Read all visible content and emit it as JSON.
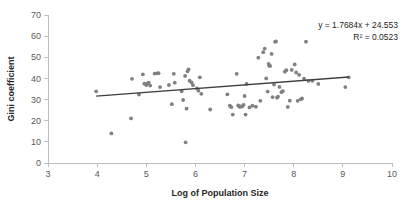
{
  "chart_data": {
    "type": "scatter",
    "title": "",
    "xlabel": "Log of Population Size",
    "ylabel": "Gini coefficient",
    "xlim": [
      3,
      10
    ],
    "ylim": [
      0,
      70
    ],
    "xticks": [
      3,
      4,
      5,
      6,
      7,
      8,
      9,
      10
    ],
    "yticks": [
      0,
      10,
      20,
      30,
      40,
      50,
      60,
      70
    ],
    "grid": false,
    "legend": null,
    "point_color": "#808080",
    "trendline_color": "#3f3f3f",
    "annotations": {
      "equation": "y = 1.7684x + 24.553",
      "r_squared": "R² = 0.0523"
    },
    "trendline": {
      "slope": 1.7684,
      "intercept": 24.553,
      "x_start": 3.98,
      "x_end": 9.12,
      "y_start": 31.59,
      "y_end": 40.68
    },
    "points": [
      [
        3.98,
        33.9
      ],
      [
        4.29,
        14.0
      ],
      [
        4.69,
        21.1
      ],
      [
        4.71,
        39.8
      ],
      [
        4.85,
        32.4
      ],
      [
        4.93,
        41.9
      ],
      [
        4.96,
        37.5
      ],
      [
        5.0,
        36.9
      ],
      [
        5.02,
        37.6
      ],
      [
        5.05,
        38.0
      ],
      [
        5.08,
        36.6
      ],
      [
        5.17,
        42.3
      ],
      [
        5.22,
        42.4
      ],
      [
        5.25,
        42.5
      ],
      [
        5.28,
        35.9
      ],
      [
        5.46,
        36.9
      ],
      [
        5.52,
        27.8
      ],
      [
        5.56,
        42.2
      ],
      [
        5.58,
        38.0
      ],
      [
        5.72,
        33.9
      ],
      [
        5.75,
        29.8
      ],
      [
        5.79,
        41.2
      ],
      [
        5.8,
        9.8
      ],
      [
        5.82,
        25.7
      ],
      [
        5.84,
        43.4
      ],
      [
        5.86,
        44.3
      ],
      [
        5.88,
        38.9
      ],
      [
        5.92,
        38.1
      ],
      [
        5.95,
        36.8
      ],
      [
        6.03,
        35.3
      ],
      [
        6.06,
        34.2
      ],
      [
        6.09,
        40.5
      ],
      [
        6.12,
        32.7
      ],
      [
        6.3,
        25.3
      ],
      [
        6.65,
        32.5
      ],
      [
        6.7,
        27.1
      ],
      [
        6.73,
        26.4
      ],
      [
        6.76,
        22.9
      ],
      [
        6.84,
        42.2
      ],
      [
        6.87,
        27.2
      ],
      [
        6.9,
        26.5
      ],
      [
        6.92,
        26.8
      ],
      [
        6.95,
        26.7
      ],
      [
        6.98,
        27.5
      ],
      [
        7.0,
        31.7
      ],
      [
        7.02,
        22.9
      ],
      [
        7.04,
        37.4
      ],
      [
        7.1,
        26.3
      ],
      [
        7.16,
        27.1
      ],
      [
        7.23,
        26.6
      ],
      [
        7.28,
        49.8
      ],
      [
        7.32,
        29.4
      ],
      [
        7.38,
        52.4
      ],
      [
        7.41,
        54.1
      ],
      [
        7.44,
        40.0
      ],
      [
        7.47,
        33.8
      ],
      [
        7.49,
        46.9
      ],
      [
        7.5,
        46.0
      ],
      [
        7.52,
        45.9
      ],
      [
        7.55,
        51.6
      ],
      [
        7.57,
        31.2
      ],
      [
        7.6,
        37.1
      ],
      [
        7.62,
        57.3
      ],
      [
        7.64,
        57.5
      ],
      [
        7.66,
        30.9
      ],
      [
        7.68,
        31.4
      ],
      [
        7.71,
        36.0
      ],
      [
        7.75,
        33.5
      ],
      [
        7.78,
        34.0
      ],
      [
        7.82,
        43.2
      ],
      [
        7.85,
        43.9
      ],
      [
        7.88,
        26.5
      ],
      [
        7.92,
        29.5
      ],
      [
        7.96,
        44.0
      ],
      [
        8.02,
        46.6
      ],
      [
        8.05,
        42.8
      ],
      [
        8.08,
        29.4
      ],
      [
        8.11,
        41.7
      ],
      [
        8.14,
        30.1
      ],
      [
        8.17,
        30.5
      ],
      [
        8.21,
        39.9
      ],
      [
        8.25,
        57.4
      ],
      [
        8.3,
        38.8
      ],
      [
        8.38,
        38.9
      ],
      [
        8.5,
        37.4
      ],
      [
        9.05,
        35.9
      ],
      [
        9.12,
        40.5
      ]
    ]
  }
}
